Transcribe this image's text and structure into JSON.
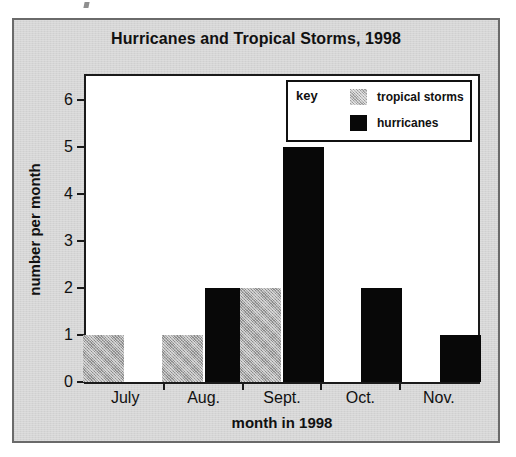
{
  "chart_data": {
    "type": "bar",
    "title": "Hurricanes and Tropical Storms, 1998",
    "xlabel": "month in 1998",
    "ylabel": "number per month",
    "categories": [
      "July",
      "Aug.",
      "Sept.",
      "Oct.",
      "Nov."
    ],
    "series": [
      {
        "name": "tropical storms",
        "color": "#a8a8a8",
        "values": [
          1,
          1,
          2,
          0,
          0
        ]
      },
      {
        "name": "hurricanes",
        "color": "#080808",
        "values": [
          0,
          2,
          5,
          2,
          1
        ]
      }
    ],
    "ylim": [
      0,
      6.5
    ],
    "yticks": [
      0,
      1,
      2,
      3,
      4,
      5,
      6
    ],
    "ytick_labels": [
      "0",
      "1",
      "2",
      "3",
      "4",
      "5",
      "6"
    ],
    "grid": false,
    "legend_position": "top-right-inside",
    "legend_title": "key"
  },
  "figure": {
    "background_color": "#d6d6d6",
    "plot_background_color": "#ffffff",
    "frame_color": "#1a1a1a"
  }
}
